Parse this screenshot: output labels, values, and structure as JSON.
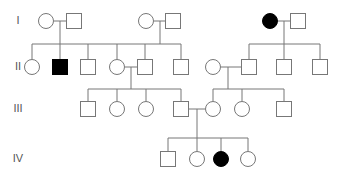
{
  "colors": {
    "line": "#777777",
    "affected": "#000000",
    "unaffected": "#ffffff"
  },
  "generations": [
    {
      "label": "I",
      "y": 21
    },
    {
      "label": "II",
      "y": 67
    },
    {
      "label": "III",
      "y": 109
    },
    {
      "label": "IV",
      "y": 159
    }
  ],
  "individuals": [
    {
      "id": "I-1",
      "sex": "female",
      "affected": false,
      "x": 46,
      "y": 21
    },
    {
      "id": "I-2",
      "sex": "male",
      "affected": false,
      "x": 74,
      "y": 21
    },
    {
      "id": "I-3",
      "sex": "female",
      "affected": false,
      "x": 146,
      "y": 21
    },
    {
      "id": "I-4",
      "sex": "male",
      "affected": false,
      "x": 173,
      "y": 21
    },
    {
      "id": "I-5",
      "sex": "female",
      "affected": true,
      "x": 270,
      "y": 21
    },
    {
      "id": "I-6",
      "sex": "male",
      "affected": false,
      "x": 298,
      "y": 21
    },
    {
      "id": "II-1",
      "sex": "female",
      "affected": false,
      "x": 32,
      "y": 67
    },
    {
      "id": "II-2",
      "sex": "male",
      "affected": true,
      "x": 60,
      "y": 67
    },
    {
      "id": "II-3",
      "sex": "male",
      "affected": false,
      "x": 88,
      "y": 67
    },
    {
      "id": "II-4",
      "sex": "female",
      "affected": false,
      "x": 117,
      "y": 67
    },
    {
      "id": "II-5",
      "sex": "male",
      "affected": false,
      "x": 145,
      "y": 67
    },
    {
      "id": "II-6",
      "sex": "male",
      "affected": false,
      "x": 181,
      "y": 67
    },
    {
      "id": "II-7",
      "sex": "female",
      "affected": false,
      "x": 213,
      "y": 67
    },
    {
      "id": "II-8",
      "sex": "male",
      "affected": false,
      "x": 249,
      "y": 67
    },
    {
      "id": "II-9",
      "sex": "male",
      "affected": false,
      "x": 284,
      "y": 67
    },
    {
      "id": "II-10",
      "sex": "male",
      "affected": false,
      "x": 320,
      "y": 67
    },
    {
      "id": "III-1",
      "sex": "male",
      "affected": false,
      "x": 88,
      "y": 109
    },
    {
      "id": "III-2",
      "sex": "female",
      "affected": false,
      "x": 117,
      "y": 109
    },
    {
      "id": "III-3",
      "sex": "female",
      "affected": false,
      "x": 146,
      "y": 109
    },
    {
      "id": "III-4",
      "sex": "male",
      "affected": false,
      "x": 181,
      "y": 109
    },
    {
      "id": "III-5",
      "sex": "female",
      "affected": false,
      "x": 213,
      "y": 109
    },
    {
      "id": "III-6",
      "sex": "female",
      "affected": false,
      "x": 242,
      "y": 109
    },
    {
      "id": "III-7",
      "sex": "male",
      "affected": false,
      "x": 284,
      "y": 109
    },
    {
      "id": "IV-1",
      "sex": "male",
      "affected": false,
      "x": 168,
      "y": 159
    },
    {
      "id": "IV-2",
      "sex": "female",
      "affected": false,
      "x": 197,
      "y": 159
    },
    {
      "id": "IV-3",
      "sex": "female",
      "affected": true,
      "x": 221,
      "y": 159
    },
    {
      "id": "IV-4",
      "sex": "female",
      "affected": false,
      "x": 248,
      "y": 159
    }
  ],
  "lines": [
    [
      54,
      21,
      67,
      21
    ],
    [
      60,
      21,
      60,
      44
    ],
    [
      32,
      44,
      145,
      44
    ],
    [
      32,
      44,
      32,
      59
    ],
    [
      60,
      44,
      60,
      60
    ],
    [
      88,
      44,
      88,
      60
    ],
    [
      117,
      44,
      117,
      59
    ],
    [
      154,
      21,
      166,
      21
    ],
    [
      160,
      21,
      160,
      44
    ],
    [
      145,
      44,
      181,
      44
    ],
    [
      145,
      44,
      145,
      60
    ],
    [
      181,
      44,
      181,
      60
    ],
    [
      278,
      21,
      291,
      21
    ],
    [
      284,
      21,
      284,
      44
    ],
    [
      249,
      44,
      320,
      44
    ],
    [
      249,
      44,
      249,
      60
    ],
    [
      284,
      44,
      284,
      60
    ],
    [
      320,
      44,
      320,
      60
    ],
    [
      125,
      67,
      138,
      67
    ],
    [
      131,
      67,
      131,
      89
    ],
    [
      88,
      89,
      181,
      89
    ],
    [
      88,
      89,
      88,
      102
    ],
    [
      117,
      89,
      117,
      101
    ],
    [
      146,
      89,
      146,
      101
    ],
    [
      181,
      89,
      181,
      102
    ],
    [
      221,
      67,
      242,
      67
    ],
    [
      228,
      67,
      228,
      89
    ],
    [
      213,
      89,
      284,
      89
    ],
    [
      213,
      89,
      213,
      101
    ],
    [
      242,
      89,
      242,
      101
    ],
    [
      284,
      89,
      284,
      102
    ],
    [
      188,
      109,
      205,
      109
    ],
    [
      197,
      109,
      197,
      138
    ],
    [
      168,
      138,
      248,
      138
    ],
    [
      168,
      138,
      168,
      152
    ],
    [
      197,
      138,
      197,
      151
    ],
    [
      221,
      138,
      221,
      151
    ],
    [
      248,
      138,
      248,
      151
    ]
  ]
}
